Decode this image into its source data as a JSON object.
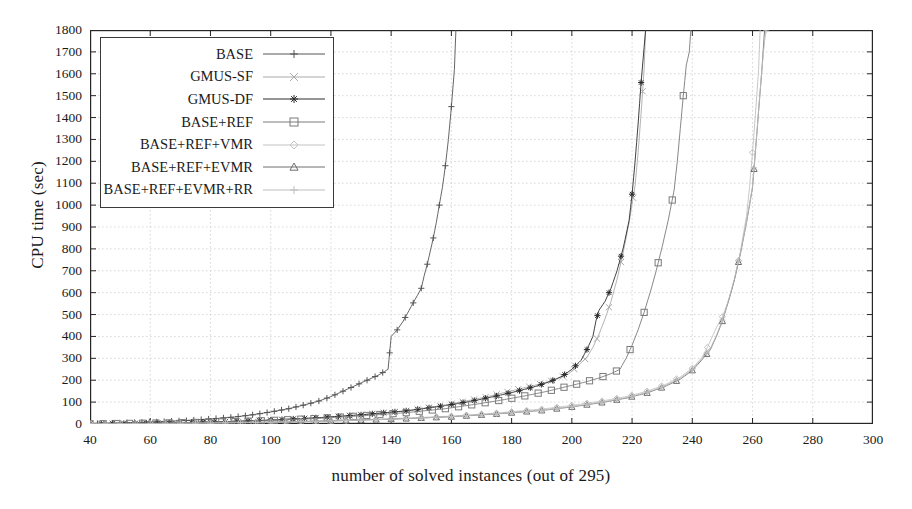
{
  "chart_data": {
    "type": "line",
    "title": "",
    "subtitle": "",
    "xlabel": "number of solved instances (out of 295)",
    "ylabel": "CPU time (sec)",
    "xlim": [
      40,
      300
    ],
    "ylim": [
      0,
      1800
    ],
    "xticks": [
      40,
      60,
      80,
      100,
      120,
      140,
      160,
      180,
      200,
      220,
      240,
      260,
      280,
      300
    ],
    "yticks": [
      0,
      100,
      200,
      300,
      400,
      500,
      600,
      700,
      800,
      900,
      1000,
      1100,
      1200,
      1300,
      1400,
      1500,
      1600,
      1700,
      1800
    ],
    "grid": true,
    "legend_position": "top-left",
    "series": [
      {
        "name": "BASE",
        "marker": "plus",
        "color": "#555555",
        "points": [
          [
            40,
            2
          ],
          [
            48,
            4
          ],
          [
            56,
            7
          ],
          [
            64,
            11
          ],
          [
            72,
            16
          ],
          [
            80,
            23
          ],
          [
            88,
            32
          ],
          [
            94,
            42
          ],
          [
            100,
            55
          ],
          [
            106,
            70
          ],
          [
            112,
            90
          ],
          [
            116,
            105
          ],
          [
            120,
            125
          ],
          [
            124,
            150
          ],
          [
            128,
            175
          ],
          [
            132,
            200
          ],
          [
            136,
            225
          ],
          [
            139,
            250
          ],
          [
            140,
            400
          ],
          [
            142,
            430
          ],
          [
            144,
            470
          ],
          [
            146,
            520
          ],
          [
            148,
            570
          ],
          [
            150,
            620
          ],
          [
            151,
            680
          ],
          [
            152,
            730
          ],
          [
            153,
            790
          ],
          [
            154,
            850
          ],
          [
            155,
            920
          ],
          [
            156,
            1000
          ],
          [
            157,
            1080
          ],
          [
            158,
            1180
          ],
          [
            159,
            1300
          ],
          [
            160,
            1450
          ],
          [
            161,
            1620
          ],
          [
            161.5,
            1800
          ]
        ]
      },
      {
        "name": "GMUS-SF",
        "marker": "x",
        "color": "#aaaaaa",
        "points": [
          [
            40,
            1
          ],
          [
            55,
            3
          ],
          [
            70,
            6
          ],
          [
            85,
            11
          ],
          [
            100,
            18
          ],
          [
            115,
            28
          ],
          [
            130,
            42
          ],
          [
            145,
            60
          ],
          [
            155,
            80
          ],
          [
            165,
            105
          ],
          [
            172,
            125
          ],
          [
            178,
            145
          ],
          [
            184,
            165
          ],
          [
            190,
            185
          ],
          [
            195,
            205
          ],
          [
            199,
            230
          ],
          [
            202,
            265
          ],
          [
            205,
            305
          ],
          [
            207,
            350
          ],
          [
            209,
            410
          ],
          [
            211,
            480
          ],
          [
            213,
            560
          ],
          [
            215,
            660
          ],
          [
            217,
            780
          ],
          [
            219,
            920
          ],
          [
            221,
            1090
          ],
          [
            222,
            1240
          ],
          [
            223,
            1420
          ],
          [
            224,
            1620
          ],
          [
            224.5,
            1800
          ]
        ]
      },
      {
        "name": "GMUS-DF",
        "marker": "star",
        "color": "#2b2b2b",
        "points": [
          [
            40,
            1
          ],
          [
            55,
            3
          ],
          [
            70,
            6
          ],
          [
            85,
            11
          ],
          [
            100,
            18
          ],
          [
            115,
            28
          ],
          [
            130,
            42
          ],
          [
            145,
            60
          ],
          [
            157,
            82
          ],
          [
            167,
            105
          ],
          [
            175,
            128
          ],
          [
            182,
            150
          ],
          [
            188,
            172
          ],
          [
            193,
            195
          ],
          [
            197,
            220
          ],
          [
            200,
            250
          ],
          [
            203,
            290
          ],
          [
            205,
            340
          ],
          [
            207,
            400
          ],
          [
            208,
            470
          ],
          [
            209,
            520
          ],
          [
            211,
            560
          ],
          [
            213,
            620
          ],
          [
            215,
            700
          ],
          [
            217,
            800
          ],
          [
            219,
            930
          ],
          [
            220,
            1050
          ],
          [
            221,
            1200
          ],
          [
            222,
            1370
          ],
          [
            223,
            1560
          ],
          [
            224,
            1720
          ],
          [
            224.5,
            1800
          ]
        ]
      },
      {
        "name": "BASE+REF",
        "marker": "square",
        "color": "#7a7a7a",
        "points": [
          [
            40,
            1
          ],
          [
            55,
            3
          ],
          [
            70,
            6
          ],
          [
            85,
            10
          ],
          [
            100,
            16
          ],
          [
            115,
            25
          ],
          [
            130,
            37
          ],
          [
            145,
            52
          ],
          [
            158,
            70
          ],
          [
            168,
            90
          ],
          [
            177,
            110
          ],
          [
            185,
            130
          ],
          [
            192,
            150
          ],
          [
            198,
            170
          ],
          [
            204,
            190
          ],
          [
            209,
            210
          ],
          [
            213,
            230
          ],
          [
            216,
            250
          ],
          [
            218,
            300
          ],
          [
            220,
            360
          ],
          [
            222,
            430
          ],
          [
            224,
            510
          ],
          [
            226,
            600
          ],
          [
            228,
            700
          ],
          [
            230,
            810
          ],
          [
            232,
            930
          ],
          [
            234,
            1070
          ],
          [
            235,
            1200
          ],
          [
            236,
            1350
          ],
          [
            237,
            1500
          ],
          [
            238,
            1640
          ],
          [
            239,
            1700
          ],
          [
            239.5,
            1800
          ]
        ]
      },
      {
        "name": "BASE+REF+VMR",
        "marker": "diamond",
        "color": "#c2c2c2",
        "points": [
          [
            40,
            1
          ],
          [
            60,
            2
          ],
          [
            80,
            5
          ],
          [
            100,
            9
          ],
          [
            120,
            15
          ],
          [
            140,
            24
          ],
          [
            160,
            36
          ],
          [
            175,
            50
          ],
          [
            190,
            68
          ],
          [
            200,
            85
          ],
          [
            210,
            105
          ],
          [
            218,
            125
          ],
          [
            225,
            150
          ],
          [
            231,
            180
          ],
          [
            236,
            215
          ],
          [
            240,
            255
          ],
          [
            243,
            300
          ],
          [
            245,
            350
          ],
          [
            247,
            410
          ],
          [
            248,
            440
          ],
          [
            250,
            490
          ],
          [
            252,
            560
          ],
          [
            254,
            660
          ],
          [
            256,
            790
          ],
          [
            258,
            950
          ],
          [
            259,
            1080
          ],
          [
            260,
            1240
          ],
          [
            261,
            1420
          ],
          [
            262,
            1620
          ],
          [
            262.5,
            1800
          ]
        ]
      },
      {
        "name": "BASE+REF+EVMR",
        "marker": "triangle",
        "color": "#6e6e6e",
        "points": [
          [
            40,
            1
          ],
          [
            60,
            2
          ],
          [
            80,
            4
          ],
          [
            100,
            8
          ],
          [
            120,
            14
          ],
          [
            140,
            22
          ],
          [
            160,
            33
          ],
          [
            175,
            46
          ],
          [
            190,
            62
          ],
          [
            200,
            78
          ],
          [
            210,
            98
          ],
          [
            218,
            118
          ],
          [
            225,
            142
          ],
          [
            231,
            172
          ],
          [
            236,
            205
          ],
          [
            240,
            245
          ],
          [
            243,
            290
          ],
          [
            246,
            340
          ],
          [
            248,
            400
          ],
          [
            250,
            470
          ],
          [
            252,
            560
          ],
          [
            254,
            660
          ],
          [
            256,
            780
          ],
          [
            258,
            920
          ],
          [
            260,
            1080
          ],
          [
            261,
            1250
          ],
          [
            262,
            1430
          ],
          [
            263,
            1600
          ],
          [
            263.5,
            1700
          ],
          [
            264,
            1800
          ]
        ]
      },
      {
        "name": "BASE+REF+EVMR+RR",
        "marker": "plus",
        "color": "#bdbdbd",
        "points": [
          [
            40,
            1
          ],
          [
            60,
            2
          ],
          [
            80,
            4
          ],
          [
            100,
            8
          ],
          [
            120,
            14
          ],
          [
            140,
            22
          ],
          [
            160,
            34
          ],
          [
            175,
            47
          ],
          [
            190,
            63
          ],
          [
            200,
            80
          ],
          [
            210,
            100
          ],
          [
            218,
            120
          ],
          [
            225,
            145
          ],
          [
            231,
            175
          ],
          [
            236,
            210
          ],
          [
            240,
            250
          ],
          [
            243,
            295
          ],
          [
            246,
            345
          ],
          [
            248,
            405
          ],
          [
            250,
            475
          ],
          [
            252,
            565
          ],
          [
            254,
            665
          ],
          [
            256,
            785
          ],
          [
            258,
            925
          ],
          [
            260,
            1085
          ],
          [
            261,
            1255
          ],
          [
            262,
            1435
          ],
          [
            263,
            1605
          ],
          [
            264,
            1750
          ],
          [
            264.5,
            1800
          ]
        ]
      }
    ]
  },
  "legend": {
    "entries": [
      {
        "label": "BASE",
        "marker": "plus",
        "color": "#555555"
      },
      {
        "label": "GMUS-SF",
        "marker": "x",
        "color": "#aaaaaa"
      },
      {
        "label": "GMUS-DF",
        "marker": "star",
        "color": "#2b2b2b"
      },
      {
        "label": "BASE+REF",
        "marker": "square",
        "color": "#7a7a7a"
      },
      {
        "label": "BASE+REF+VMR",
        "marker": "diamond",
        "color": "#c2c2c2"
      },
      {
        "label": "BASE+REF+EVMR",
        "marker": "triangle",
        "color": "#6e6e6e"
      },
      {
        "label": "BASE+REF+EVMR+RR",
        "marker": "plus",
        "color": "#bdbdbd"
      }
    ]
  },
  "colors": {
    "axis": "#262626",
    "grid": "#c9c9c9",
    "background": "#ffffff"
  }
}
